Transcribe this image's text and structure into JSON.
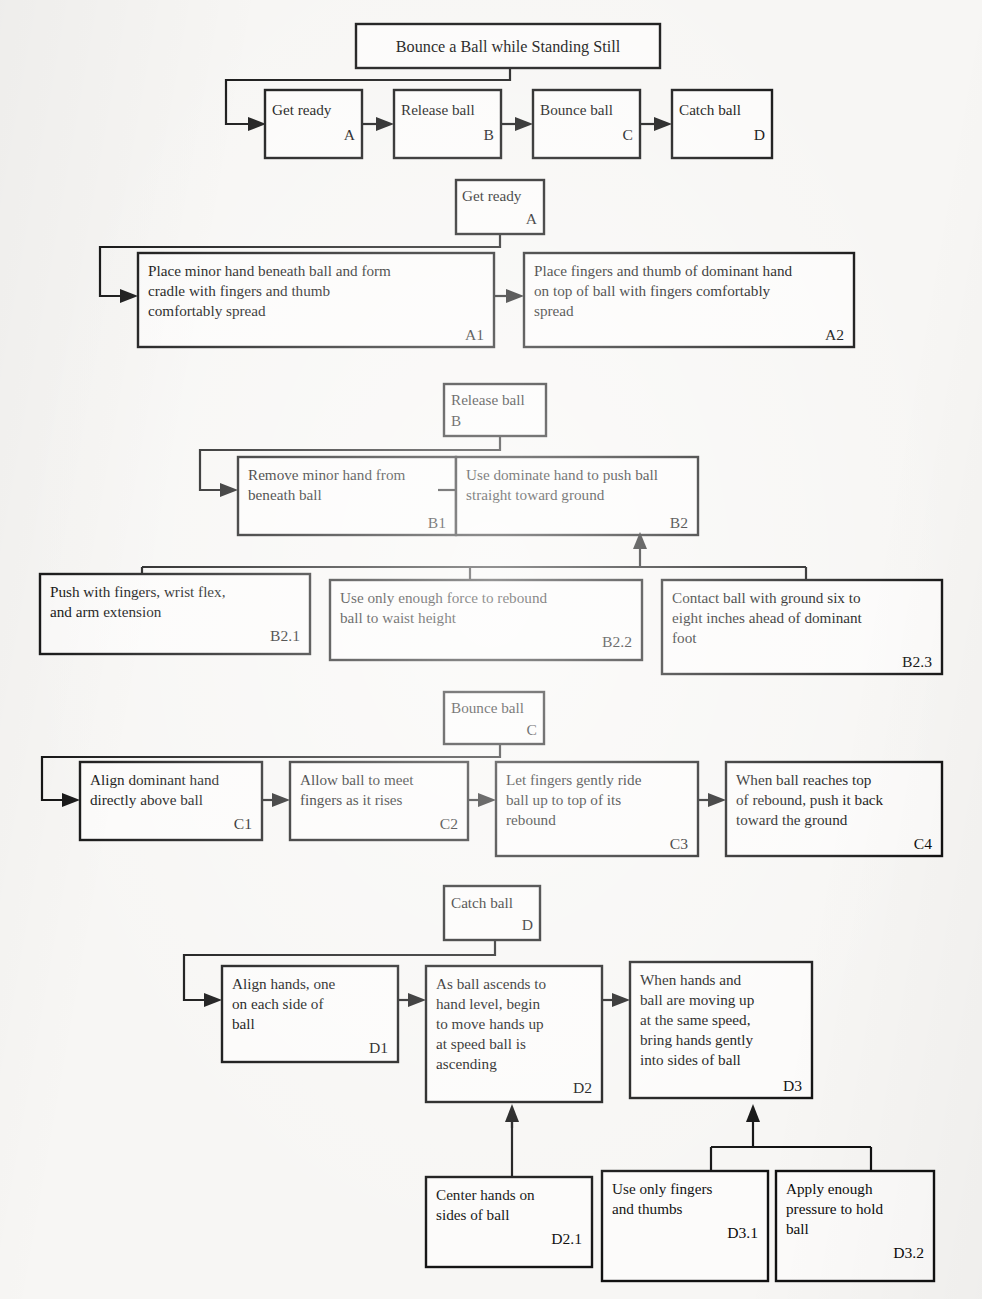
{
  "document": {
    "kind": "hierarchical-task-analysis-diagram",
    "title": "Bounce a Ball while Standing Still",
    "background_color": "#f7f6f4",
    "ink_color": "#111111",
    "box_fill": "#fcfbfa"
  },
  "levels": {
    "level0": {
      "title_box": {
        "label": "Bounce a Ball while Standing Still"
      }
    },
    "level1": {
      "boxes": [
        {
          "label": "Get ready",
          "code": "A"
        },
        {
          "label": "Release ball",
          "code": "B"
        },
        {
          "label": "Bounce ball",
          "code": "C"
        },
        {
          "label": "Catch ball",
          "code": "D"
        }
      ]
    }
  },
  "sections": [
    {
      "id": "A",
      "parent": {
        "label": "Get ready",
        "code": "A"
      },
      "children": [
        {
          "code": "A1",
          "lines": [
            "Place minor hand beneath ball and form",
            "cradle with fingers and thumb",
            "comfortably spread"
          ]
        },
        {
          "code": "A2",
          "lines": [
            "Place fingers and thumb of dominant hand",
            "on top of ball with fingers comfortably",
            "spread"
          ]
        }
      ]
    },
    {
      "id": "B",
      "parent": {
        "label": "Release ball",
        "code": "B"
      },
      "children": [
        {
          "code": "B1",
          "lines": [
            "Remove minor hand from",
            "beneath ball"
          ]
        },
        {
          "code": "B2",
          "lines": [
            "Use dominate hand to push ball",
            "straight toward ground"
          ]
        }
      ],
      "grandchildren": {
        "parent_code": "B2",
        "boxes": [
          {
            "code": "B2.1",
            "lines": [
              "Push with fingers, wrist flex,",
              "and arm extension"
            ]
          },
          {
            "code": "B2.2",
            "lines": [
              "Use only enough force to rebound",
              "ball to waist height"
            ]
          },
          {
            "code": "B2.3",
            "lines": [
              "Contact ball with ground six to",
              "eight inches ahead of dominant",
              "foot"
            ]
          }
        ]
      }
    },
    {
      "id": "C",
      "parent": {
        "label": "Bounce ball",
        "code": "C"
      },
      "children": [
        {
          "code": "C1",
          "lines": [
            "Align dominant hand",
            "directly above ball"
          ]
        },
        {
          "code": "C2",
          "lines": [
            "Allow ball to meet",
            "fingers as it rises"
          ]
        },
        {
          "code": "C3",
          "lines": [
            "Let fingers gently ride",
            "ball up to top of its",
            "rebound"
          ]
        },
        {
          "code": "C4",
          "lines": [
            "When ball reaches top",
            "of rebound, push it back",
            "toward the ground"
          ]
        }
      ]
    },
    {
      "id": "D",
      "parent": {
        "label": "Catch ball",
        "code": "D"
      },
      "children": [
        {
          "code": "D1",
          "lines": [
            "Align hands, one",
            "on each side of",
            "ball"
          ]
        },
        {
          "code": "D2",
          "lines": [
            "As ball ascends to",
            "hand level, begin",
            "to move hands up",
            "at speed ball is",
            "ascending"
          ]
        },
        {
          "code": "D3",
          "lines": [
            "When hands and",
            "ball are moving up",
            "at the same speed,",
            "bring hands gently",
            "into sides of ball"
          ]
        }
      ],
      "grandchildren": [
        {
          "parent_code": "D2",
          "boxes": [
            {
              "code": "D2.1",
              "lines": [
                "Center hands on",
                "sides of ball"
              ]
            }
          ]
        },
        {
          "parent_code": "D3",
          "boxes": [
            {
              "code": "D3.1",
              "lines": [
                "Use only fingers",
                "and thumbs"
              ]
            },
            {
              "code": "D3.2",
              "lines": [
                "Apply enough",
                "pressure to hold",
                "ball"
              ]
            }
          ]
        }
      ]
    }
  ]
}
